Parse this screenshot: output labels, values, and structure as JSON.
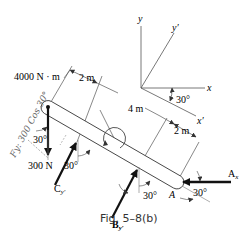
{
  "figure": {
    "caption": "Fig. 5–8(b)",
    "colors": {
      "ink": "#1a1a1a",
      "line": "#555555",
      "annotation": "#666666"
    }
  },
  "axes": {
    "x_label": "x",
    "y_label": "y",
    "x_prime_label": "x′",
    "y_prime_label": "y′",
    "rotation_label": "30°"
  },
  "loads": {
    "moment_label": "4000 N · m",
    "force_300_label": "300 N",
    "cy_label": "C",
    "cy_sub": "y′",
    "by_label": "B",
    "by_sub": "y′",
    "ax_label": "A",
    "ax_sub": "x",
    "point_a_label": "A"
  },
  "dimensions": {
    "d1": "2 m",
    "d2": "4 m",
    "d3": "2 m"
  },
  "angles": {
    "at_300n": "30°",
    "at_cy": "30°",
    "at_by": "30°",
    "at_ax": "30°"
  },
  "annotation": {
    "handwritten": "Fy: 300 Cos 30°"
  }
}
